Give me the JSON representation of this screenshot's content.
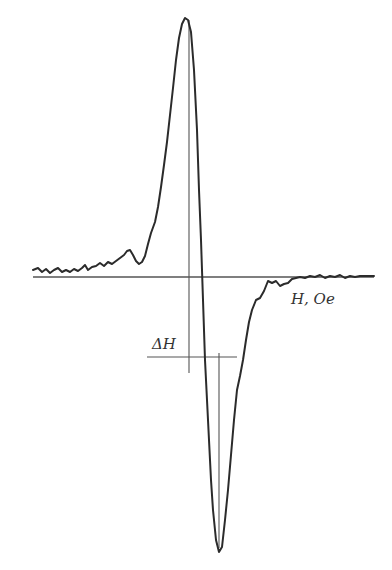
{
  "chart_data": {
    "type": "line",
    "title": "",
    "xlabel": "H, Oe",
    "ylabel": "",
    "grid": false,
    "legend": null,
    "annotations": [
      {
        "text": "ΔH",
        "meaning": "peak-to-peak linewidth between the positive maximum and negative minimum"
      }
    ],
    "series": [
      {
        "name": "dP/dH",
        "points": [
          [
            33,
            270
          ],
          [
            38,
            268
          ],
          [
            42,
            272
          ],
          [
            46,
            269
          ],
          [
            50,
            273
          ],
          [
            54,
            270
          ],
          [
            58,
            268
          ],
          [
            62,
            272
          ],
          [
            66,
            270
          ],
          [
            70,
            272
          ],
          [
            74,
            269
          ],
          [
            78,
            271
          ],
          [
            82,
            268
          ],
          [
            85,
            265
          ],
          [
            88,
            270
          ],
          [
            92,
            267
          ],
          [
            96,
            266
          ],
          [
            100,
            263
          ],
          [
            104,
            266
          ],
          [
            108,
            262
          ],
          [
            112,
            264
          ],
          [
            116,
            261
          ],
          [
            120,
            258
          ],
          [
            124,
            255
          ],
          [
            127,
            251
          ],
          [
            130,
            250
          ],
          [
            133,
            255
          ],
          [
            136,
            261
          ],
          [
            139,
            264
          ],
          [
            142,
            262
          ],
          [
            145,
            256
          ],
          [
            148,
            244
          ],
          [
            151,
            233
          ],
          [
            155,
            222
          ],
          [
            158,
            207
          ],
          [
            161,
            187
          ],
          [
            164,
            165
          ],
          [
            167,
            142
          ],
          [
            170,
            115
          ],
          [
            173,
            88
          ],
          [
            176,
            60
          ],
          [
            179,
            38
          ],
          [
            182,
            24
          ],
          [
            185,
            18
          ],
          [
            188,
            20
          ],
          [
            191,
            32
          ],
          [
            194,
            70
          ],
          [
            197,
            130
          ],
          [
            199,
            190
          ],
          [
            201,
            240
          ],
          [
            203,
            300
          ],
          [
            205,
            360
          ],
          [
            207,
            400
          ],
          [
            209,
            440
          ],
          [
            211,
            480
          ],
          [
            213,
            510
          ],
          [
            216,
            540
          ],
          [
            219,
            552
          ],
          [
            222,
            547
          ],
          [
            225,
            520
          ],
          [
            228,
            490
          ],
          [
            231,
            455
          ],
          [
            234,
            420
          ],
          [
            237,
            390
          ],
          [
            240,
            376
          ],
          [
            243,
            360
          ],
          [
            246,
            340
          ],
          [
            249,
            322
          ],
          [
            252,
            310
          ],
          [
            256,
            300
          ],
          [
            260,
            298
          ],
          [
            264,
            291
          ],
          [
            268,
            281
          ],
          [
            272,
            283
          ],
          [
            276,
            281
          ],
          [
            280,
            286
          ],
          [
            284,
            284
          ],
          [
            288,
            283
          ],
          [
            292,
            279
          ],
          [
            296,
            278
          ],
          [
            300,
            277
          ],
          [
            305,
            278
          ],
          [
            310,
            276
          ],
          [
            315,
            277
          ],
          [
            320,
            275
          ],
          [
            325,
            278
          ],
          [
            330,
            276
          ],
          [
            335,
            277
          ],
          [
            340,
            275
          ],
          [
            345,
            278
          ],
          [
            350,
            276
          ],
          [
            355,
            277
          ],
          [
            360,
            276
          ],
          [
            365,
            276
          ],
          [
            370,
            276
          ],
          [
            374,
            276
          ]
        ]
      }
    ],
    "baseline": {
      "y": 277,
      "x_start": 33,
      "x_end": 374
    },
    "markers": {
      "max_vertical": {
        "x": 189,
        "y_top": 20,
        "y_bottom": 373
      },
      "min_vertical": {
        "x": 219,
        "y_top": 353,
        "y_bottom": 548
      },
      "deltaH_horizontal": {
        "y": 357,
        "x_start": 147,
        "x_end": 237
      }
    }
  },
  "labels": {
    "x_axis": "H, Oe",
    "delta_h": "ΔH"
  },
  "colors": {
    "curve": "#2b2b2b",
    "axis": "#555555",
    "text": "#333333"
  }
}
